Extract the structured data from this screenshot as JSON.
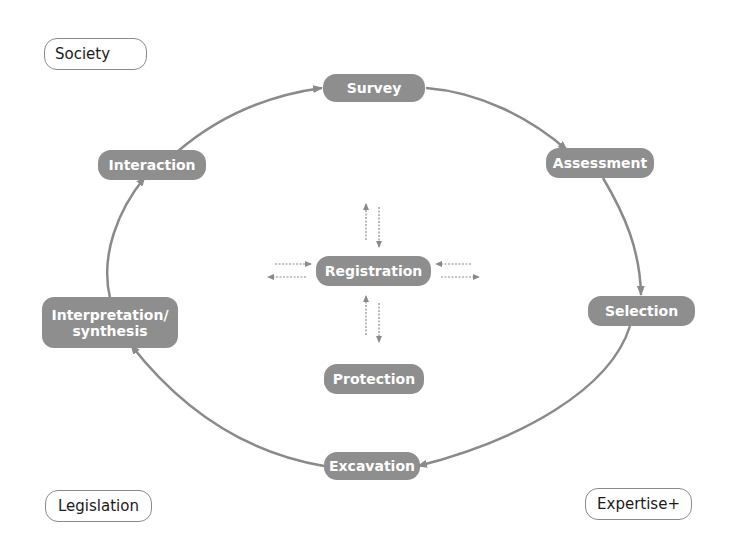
{
  "colors": {
    "node_fill": "#8e8e8e",
    "node_text": "#ffffff",
    "arrow": "#8a8a8a",
    "outline_text": "#1a1a1a"
  },
  "cycle_nodes": {
    "survey": "Survey",
    "assessment": "Assessment",
    "selection": "Selection",
    "excavation": "Excavation",
    "interpretation_line1": "Interpretation/",
    "interpretation_line2": "synthesis",
    "interaction": "Interaction"
  },
  "center_nodes": {
    "registration": "Registration",
    "protection": "Protection"
  },
  "context_nodes": {
    "society": "Society",
    "legislation": "Legislation",
    "expertise": "Expertise+"
  },
  "cycle_order": [
    "Survey",
    "Assessment",
    "Selection",
    "Excavation",
    "Interpretation/synthesis",
    "Interaction",
    "Survey"
  ]
}
